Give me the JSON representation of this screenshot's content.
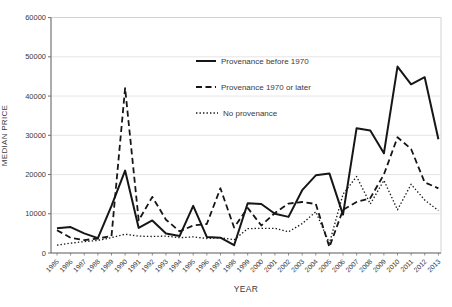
{
  "chart_data": {
    "type": "line",
    "title": "",
    "xlabel": "YEAR",
    "ylabel": "MEDIAN PRICE",
    "ylim": [
      0,
      60000
    ],
    "yticks": [
      0,
      10000,
      20000,
      30000,
      40000,
      50000,
      60000
    ],
    "grid": "horizontal",
    "legend_position": "upper-center-inside",
    "x": [
      1985,
      1986,
      1987,
      1988,
      1989,
      1990,
      1991,
      1992,
      1993,
      1994,
      1995,
      1996,
      1997,
      1998,
      1999,
      2000,
      2001,
      2002,
      2003,
      2004,
      2005,
      2006,
      2007,
      2008,
      2009,
      2010,
      2011,
      2012,
      2013
    ],
    "series": [
      {
        "name": "Provenance before 1970",
        "style": "solid",
        "values": [
          6300,
          6600,
          5000,
          3800,
          12000,
          21000,
          6400,
          8300,
          5000,
          4300,
          12000,
          4100,
          3900,
          2000,
          12700,
          12500,
          10000,
          9200,
          16000,
          19800,
          20300,
          9800,
          31800,
          31200,
          25400,
          47500,
          43000,
          44800,
          29000
        ]
      },
      {
        "name": "Provenance 1970 or later",
        "style": "dashed",
        "values": [
          5800,
          3900,
          3300,
          3700,
          4300,
          42000,
          8300,
          14300,
          8500,
          5500,
          7000,
          7400,
          16500,
          6500,
          11500,
          7000,
          10200,
          12600,
          13000,
          12500,
          1500,
          11000,
          13000,
          14000,
          20000,
          29500,
          26500,
          18000,
          16500
        ]
      },
      {
        "name": "No provenance",
        "style": "dotted",
        "values": [
          2000,
          2500,
          2900,
          3200,
          3900,
          4800,
          4300,
          4200,
          4300,
          3900,
          4100,
          3700,
          3900,
          3400,
          6200,
          6300,
          6300,
          5400,
          7500,
          10500,
          2500,
          15000,
          19500,
          12500,
          18500,
          11000,
          17500,
          13500,
          10800
        ]
      }
    ]
  },
  "colors": {
    "line": "#161616",
    "grid": "#dedede",
    "axis": "#6e6e6e",
    "border": "#c9c9c9",
    "text": "#3a3a3a"
  }
}
